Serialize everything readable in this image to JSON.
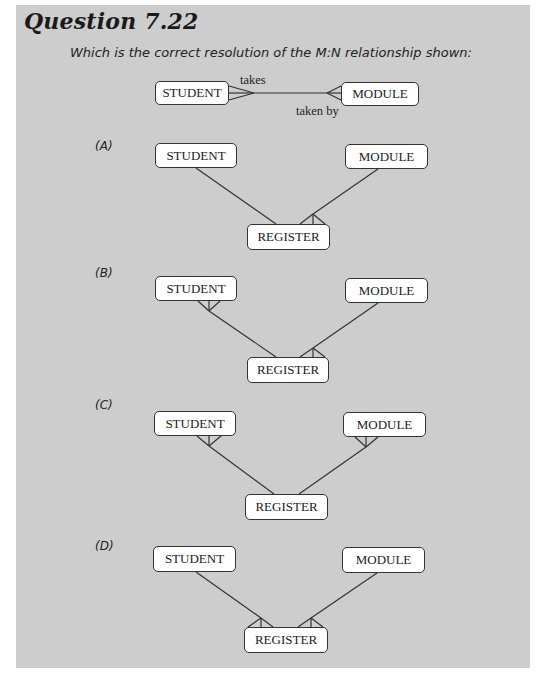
{
  "question": {
    "title": "Question 7.22",
    "prompt": "Which is the correct resolution of the M:N relationship shown:"
  },
  "original": {
    "left_entity": "STUDENT",
    "right_entity": "MODULE",
    "label_top": "takes",
    "label_bottom": "taken by",
    "left_end": "many",
    "right_end": "many"
  },
  "options": [
    {
      "label": "(A)",
      "left_entity": "STUDENT",
      "right_entity": "MODULE",
      "link_entity": "REGISTER",
      "crowfeet": [
        "register-right"
      ]
    },
    {
      "label": "(B)",
      "left_entity": "STUDENT",
      "right_entity": "MODULE",
      "link_entity": "REGISTER",
      "crowfeet": [
        "student",
        "register-right"
      ]
    },
    {
      "label": "(C)",
      "left_entity": "STUDENT",
      "right_entity": "MODULE",
      "link_entity": "REGISTER",
      "crowfeet": [
        "student",
        "module"
      ]
    },
    {
      "label": "(D)",
      "left_entity": "STUDENT",
      "right_entity": "MODULE",
      "link_entity": "REGISTER",
      "crowfeet": [
        "register-left",
        "register-right"
      ]
    }
  ],
  "colors": {
    "panel_bg": "#cdcdcd",
    "entity_bg": "#ffffff",
    "line": "#333333"
  }
}
